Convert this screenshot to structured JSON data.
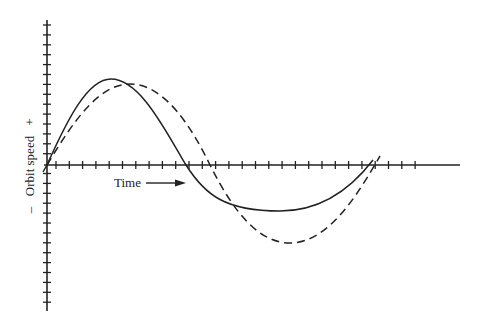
{
  "chart_data": {
    "type": "line",
    "title": "",
    "xlabel": "Time",
    "ylabel": "Orbit speed",
    "y_positive_marker": "+",
    "y_negative_marker": "–",
    "grid": false,
    "legend": null,
    "axis_ticks": {
      "x_tick_count": 29,
      "y_tick_count": 36
    },
    "series": [
      {
        "name": "solid",
        "style": "solid",
        "points_px": [
          [
            47,
            165
          ],
          [
            111,
            79
          ],
          [
            186,
            165
          ],
          [
            280,
            211
          ],
          [
            373,
            160
          ]
        ]
      },
      {
        "name": "dashed",
        "style": "dashed",
        "points_px": [
          [
            47,
            165
          ],
          [
            130,
            84
          ],
          [
            210,
            165
          ],
          [
            290,
            243
          ],
          [
            378,
            156
          ]
        ]
      }
    ]
  },
  "labels": {
    "time": "Time",
    "orbit_speed": "Orbit speed",
    "plus": "+",
    "minus": "–"
  },
  "colors": {
    "ink": "#222222",
    "background": "#ffffff"
  }
}
